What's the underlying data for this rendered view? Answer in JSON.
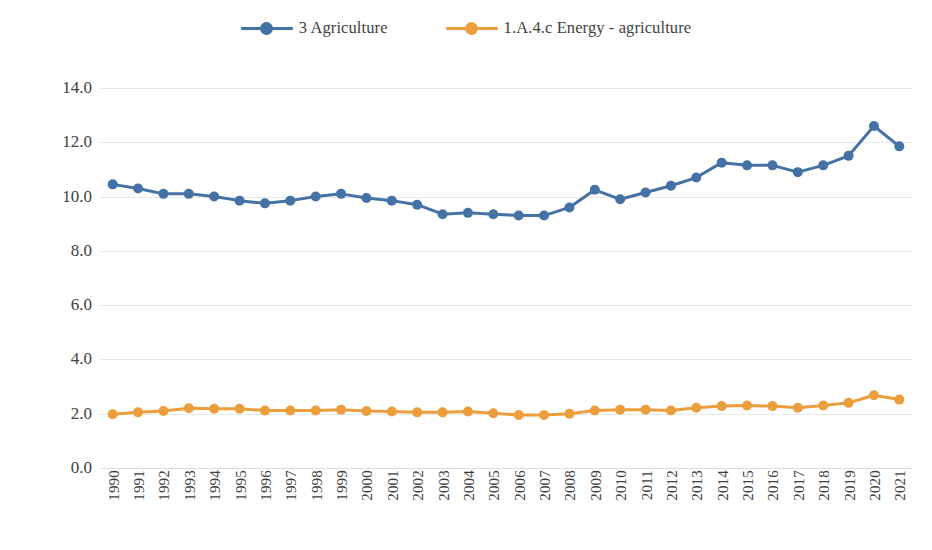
{
  "legend": {
    "position": "top-center",
    "items": [
      {
        "label": "3 Agriculture",
        "color": "#4472A4",
        "key": "series-agriculture"
      },
      {
        "label": "1.A.4.c Energy - agriculture",
        "color": "#ED9E3C",
        "key": "series-energy-agriculture"
      }
    ]
  },
  "axes": {
    "y_ticks": [
      "14.0",
      "12.0",
      "10.0",
      "8.0",
      "6.0",
      "4.0",
      "2.0",
      "0.0"
    ],
    "x_ticks": [
      "1990",
      "1991",
      "1992",
      "1993",
      "1994",
      "1995",
      "1996",
      "1997",
      "1998",
      "1999",
      "2000",
      "2001",
      "2002",
      "2003",
      "2004",
      "2005",
      "2006",
      "2007",
      "2008",
      "2009",
      "2010",
      "2011",
      "2012",
      "2013",
      "2014",
      "2015",
      "2016",
      "2017",
      "2018",
      "2019",
      "2020",
      "2021"
    ]
  },
  "colors": {
    "series_blue": "#4472A4",
    "series_orange": "#ED9E3C",
    "gridline": "#e8e8e8",
    "text": "#404040"
  },
  "chart_data": {
    "type": "line",
    "title": "",
    "subtitle": "",
    "xlabel": "",
    "ylabel": "",
    "ylim": [
      0,
      14
    ],
    "ytick_step": 2,
    "grid": true,
    "legend_position": "top-center",
    "markers": true,
    "categories": [
      "1990",
      "1991",
      "1992",
      "1993",
      "1994",
      "1995",
      "1996",
      "1997",
      "1998",
      "1999",
      "2000",
      "2001",
      "2002",
      "2003",
      "2004",
      "2005",
      "2006",
      "2007",
      "2008",
      "2009",
      "2010",
      "2011",
      "2012",
      "2013",
      "2014",
      "2015",
      "2016",
      "2017",
      "2018",
      "2019",
      "2020",
      "2021"
    ],
    "series": [
      {
        "name": "3 Agriculture",
        "color": "#4472A4",
        "values": [
          10.45,
          10.3,
          10.1,
          10.1,
          10.0,
          9.85,
          9.75,
          9.85,
          10.0,
          10.1,
          9.95,
          9.85,
          9.7,
          9.35,
          9.4,
          9.35,
          9.3,
          9.3,
          9.6,
          10.25,
          9.9,
          10.15,
          10.4,
          10.7,
          11.25,
          11.15,
          11.15,
          10.9,
          11.15,
          11.5,
          12.6,
          11.85
        ]
      },
      {
        "name": "1.A.4.c Energy - agriculture",
        "color": "#ED9E3C",
        "values": [
          1.98,
          2.05,
          2.1,
          2.2,
          2.18,
          2.18,
          2.12,
          2.12,
          2.12,
          2.15,
          2.1,
          2.08,
          2.05,
          2.05,
          2.08,
          2.02,
          1.95,
          1.95,
          2.0,
          2.12,
          2.15,
          2.15,
          2.12,
          2.22,
          2.28,
          2.3,
          2.28,
          2.22,
          2.3,
          2.4,
          2.68,
          2.52
        ]
      }
    ]
  }
}
